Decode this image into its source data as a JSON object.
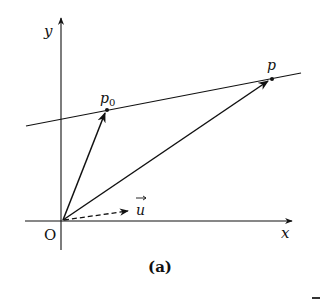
{
  "diagram": {
    "caption": "(a)",
    "axes": {
      "x_label": "x",
      "y_label": "y",
      "origin_label": "O"
    },
    "points": [
      {
        "name": "p0",
        "label": "p",
        "subscript": "0"
      },
      {
        "name": "p",
        "label": "p"
      }
    ],
    "vectors": [
      {
        "name": "u",
        "label": "u",
        "style": "dashed",
        "has_arrow_accent": true
      },
      {
        "name": "Op0",
        "style": "solid"
      },
      {
        "name": "Op",
        "style": "solid"
      }
    ],
    "line": {
      "description": "line through p0 and p"
    },
    "colors": {
      "ink": "#111111",
      "background": "#ffffff"
    }
  }
}
